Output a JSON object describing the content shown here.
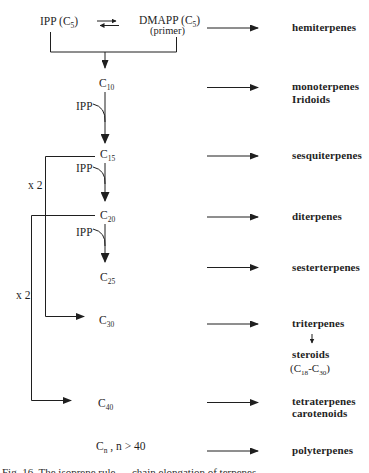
{
  "colors": {
    "ink": "#1f1f1f",
    "background": "#ffffff"
  },
  "header": {
    "ipp": {
      "pre": "IPP (C",
      "sub": "5",
      "post": ")"
    },
    "dmapp": {
      "pre": "DMAPP (C",
      "sub": "5",
      "post": ")"
    },
    "primer": "(primer)"
  },
  "chain": {
    "ipp_label": "IPP",
    "x2_label": "x 2",
    "nodes": {
      "c10": {
        "base": "C",
        "sub": "10"
      },
      "c15": {
        "base": "C",
        "sub": "15"
      },
      "c20": {
        "base": "C",
        "sub": "20"
      },
      "c25": {
        "base": "C",
        "sub": "25"
      },
      "c30": {
        "base": "C",
        "sub": "30"
      },
      "c40": {
        "base": "C",
        "sub": "40"
      },
      "cn": {
        "base": "C",
        "sub": "n",
        "rest": " ,  n > 40"
      }
    }
  },
  "products": {
    "hemiterpenes": "hemiterpenes",
    "monoterpenes_line1": "monoterpenes",
    "monoterpenes_line2": "Iridoids",
    "sesquiterpenes": "sesquiterpenes",
    "diterpenes": "diterpenes",
    "sesterterpenes": "sesterterpenes",
    "triterpenes": "triterpenes",
    "steroids": "steroids",
    "steroids_range": {
      "p1": "(C",
      "s1": "18",
      "p2": "-C",
      "s2": "30",
      "p3": ")"
    },
    "tetraterpenes_line1": "tetraterpenes",
    "tetraterpenes_line2": "carotenoids",
    "polyterpenes": "polyterpenes"
  },
  "footer": {
    "cutoff_caption": "Fig. 16. The isoprene rule — chain elongation of terpenes from C5 units"
  }
}
